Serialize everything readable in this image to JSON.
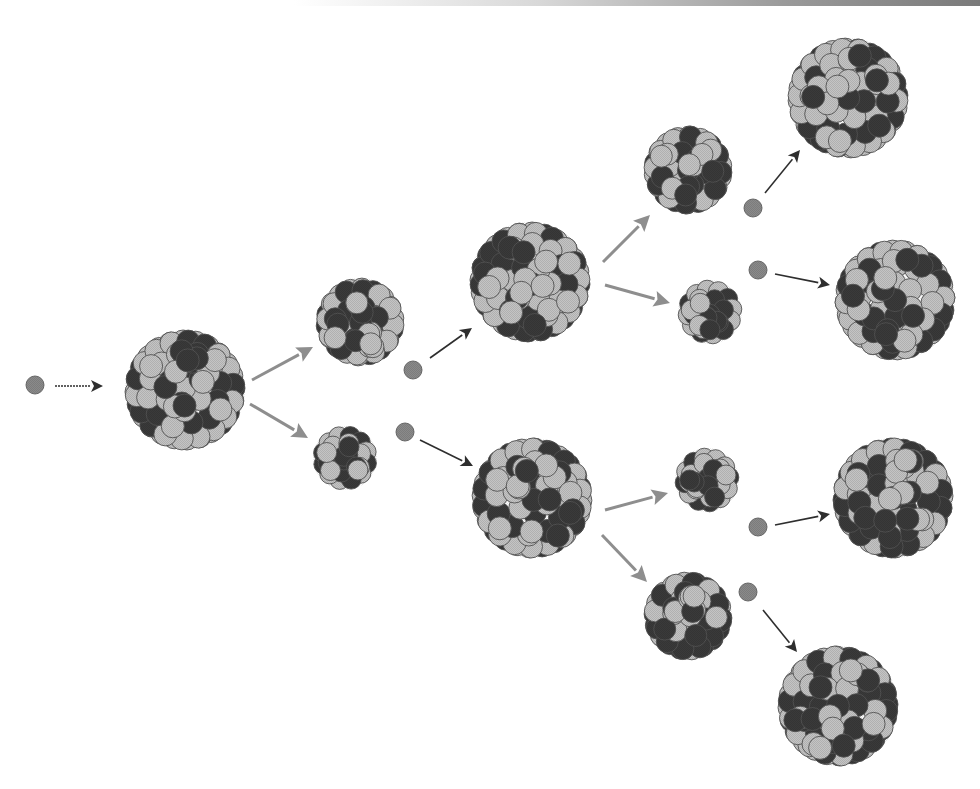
{
  "diagram": {
    "colors": {
      "background": "#ffffff",
      "proton": "#c4c4c4",
      "neutron_in_nucleus": "#3a3a3a",
      "free_neutron": "#8a8a8a",
      "outline": "#555555",
      "arrow_dark": "#2e2e2e",
      "arrow_light": "#8e8e8e"
    },
    "nodes": [
      {
        "id": "n0",
        "type": "neutron",
        "label": "incoming-neutron",
        "x": 35,
        "y": 385
      },
      {
        "id": "u1",
        "type": "nucleus",
        "label": "heavy-nucleus-gen-1",
        "x": 185,
        "y": 390,
        "size": "large",
        "seed": 11
      },
      {
        "id": "f1a",
        "type": "nucleus",
        "label": "fission-fragment-1a",
        "x": 360,
        "y": 322,
        "size": "medium",
        "seed": 12
      },
      {
        "id": "f1b",
        "type": "nucleus",
        "label": "fission-fragment-1b",
        "x": 345,
        "y": 458,
        "size": "small",
        "seed": 13
      },
      {
        "id": "n1a",
        "type": "neutron",
        "label": "released-neutron-1a",
        "x": 413,
        "y": 370
      },
      {
        "id": "n1b",
        "type": "neutron",
        "label": "released-neutron-1b",
        "x": 405,
        "y": 432
      },
      {
        "id": "u2a",
        "type": "nucleus",
        "label": "heavy-nucleus-gen-2a",
        "x": 530,
        "y": 282,
        "size": "large",
        "seed": 21
      },
      {
        "id": "u2b",
        "type": "nucleus",
        "label": "heavy-nucleus-gen-2b",
        "x": 532,
        "y": 498,
        "size": "large",
        "seed": 22
      },
      {
        "id": "f2a",
        "type": "nucleus",
        "label": "fission-fragment-2a",
        "x": 688,
        "y": 170,
        "size": "medium",
        "seed": 31
      },
      {
        "id": "f2b",
        "type": "nucleus",
        "label": "fission-fragment-2b",
        "x": 710,
        "y": 312,
        "size": "small",
        "seed": 32
      },
      {
        "id": "f2c",
        "type": "nucleus",
        "label": "fission-fragment-2c",
        "x": 707,
        "y": 480,
        "size": "small",
        "seed": 33
      },
      {
        "id": "f2d",
        "type": "nucleus",
        "label": "fission-fragment-2d",
        "x": 688,
        "y": 616,
        "size": "medium",
        "seed": 34
      },
      {
        "id": "n2a",
        "type": "neutron",
        "label": "released-neutron-2a",
        "x": 753,
        "y": 208
      },
      {
        "id": "n2b",
        "type": "neutron",
        "label": "released-neutron-2b",
        "x": 758,
        "y": 270
      },
      {
        "id": "n2c",
        "type": "neutron",
        "label": "released-neutron-2c",
        "x": 758,
        "y": 527
      },
      {
        "id": "n2d",
        "type": "neutron",
        "label": "released-neutron-2d",
        "x": 748,
        "y": 592
      },
      {
        "id": "u3a",
        "type": "nucleus",
        "label": "heavy-nucleus-gen-3a",
        "x": 848,
        "y": 98,
        "size": "large",
        "seed": 41
      },
      {
        "id": "u3b",
        "type": "nucleus",
        "label": "heavy-nucleus-gen-3b",
        "x": 895,
        "y": 300,
        "size": "large",
        "seed": 42
      },
      {
        "id": "u3c",
        "type": "nucleus",
        "label": "heavy-nucleus-gen-3c",
        "x": 893,
        "y": 498,
        "size": "large",
        "seed": 43
      },
      {
        "id": "u3d",
        "type": "nucleus",
        "label": "heavy-nucleus-gen-3d",
        "x": 838,
        "y": 706,
        "size": "large",
        "seed": 44
      }
    ],
    "arrows": [
      {
        "label": "neutron-path-0",
        "from": [
          55,
          386
        ],
        "to": [
          103,
          386
        ],
        "style": "dark-dotted"
      },
      {
        "label": "fission-path-1a",
        "from": [
          252,
          380
        ],
        "to": [
          313,
          347
        ],
        "style": "light"
      },
      {
        "label": "fission-path-1b",
        "from": [
          250,
          404
        ],
        "to": [
          308,
          438
        ],
        "style": "light"
      },
      {
        "label": "neutron-path-1a",
        "from": [
          430,
          358
        ],
        "to": [
          472,
          328
        ],
        "style": "dark"
      },
      {
        "label": "neutron-path-1b",
        "from": [
          420,
          440
        ],
        "to": [
          473,
          466
        ],
        "style": "dark"
      },
      {
        "label": "fission-path-2a",
        "from": [
          603,
          262
        ],
        "to": [
          650,
          215
        ],
        "style": "light"
      },
      {
        "label": "fission-path-2b",
        "from": [
          605,
          285
        ],
        "to": [
          670,
          303
        ],
        "style": "light"
      },
      {
        "label": "fission-path-2c",
        "from": [
          605,
          510
        ],
        "to": [
          668,
          493
        ],
        "style": "light"
      },
      {
        "label": "fission-path-2d",
        "from": [
          602,
          535
        ],
        "to": [
          647,
          582
        ],
        "style": "light"
      },
      {
        "label": "neutron-path-2a",
        "from": [
          765,
          193
        ],
        "to": [
          800,
          150
        ],
        "style": "dark"
      },
      {
        "label": "neutron-path-2b",
        "from": [
          775,
          274
        ],
        "to": [
          830,
          285
        ],
        "style": "dark"
      },
      {
        "label": "neutron-path-2c",
        "from": [
          775,
          525
        ],
        "to": [
          830,
          514
        ],
        "style": "dark"
      },
      {
        "label": "neutron-path-2d",
        "from": [
          763,
          610
        ],
        "to": [
          797,
          652
        ],
        "style": "dark"
      }
    ]
  }
}
